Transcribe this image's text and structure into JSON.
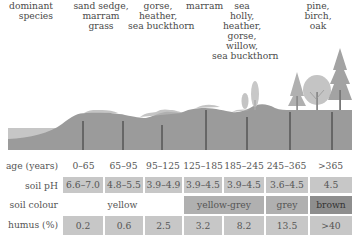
{
  "species": {
    "header": "dominant\nspecies",
    "columns": [
      {
        "label": "sand sedge,\nmarram\ngrass"
      },
      {
        "label": "gorse,\nheather,\nsea buckthorn"
      },
      {
        "label": "marram"
      },
      {
        "label": "sea\nholly,\nheather,\ngorse,\nwillow,\nsea buckthorn"
      },
      {
        "label": "pine,\nbirch,\noak"
      }
    ]
  },
  "table": {
    "row_labels": {
      "age": "age (years)",
      "ph": "soil pH",
      "colour": "soil colour",
      "humus": "humus (%)"
    },
    "age": [
      "0–65",
      "65–95",
      "95–125",
      "125–185",
      "185–245",
      "245–365",
      ">365"
    ],
    "ph": [
      "6.6–7.0",
      "4.8–5.5",
      "3.9–4.9",
      "3.9–4.5",
      "3.9–4.5",
      "3.6–4.5",
      "4.5"
    ],
    "colour": [
      {
        "label": "yellow",
        "span": 3
      },
      {
        "label": "yellow-grey",
        "span": 2
      },
      {
        "label": "grey",
        "span": 1
      },
      {
        "label": "brown",
        "span": 1
      }
    ],
    "humus": [
      "0.2",
      "0.6",
      "2.5",
      "3.2",
      "8.2",
      "13.5",
      ">40"
    ]
  },
  "colors": {
    "ground": "#9a9a9a",
    "sea": "#c4c4c4",
    "cell_light": "#c7c7c7",
    "cell_mid": "#b0b0b0",
    "cell_dark": "#8e8e8e",
    "divider": "#333333"
  }
}
